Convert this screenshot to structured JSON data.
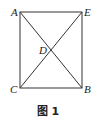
{
  "figure": {
    "caption": "图 1",
    "points": {
      "A": "A",
      "E": "E",
      "D": "D",
      "C": "C",
      "B": "B"
    },
    "shape": "rectangle AEBC with diagonals AB and EC intersecting at D",
    "line_color": "#333333"
  }
}
